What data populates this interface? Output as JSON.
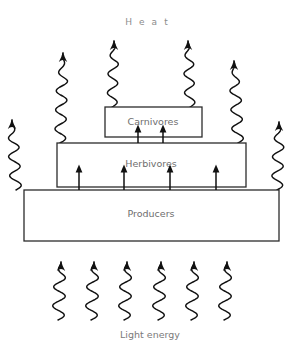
{
  "diagram": {
    "title_label": "Heat",
    "caption_label": "Light energy",
    "background_color": "#ffffff",
    "line_color": "#2b2b2b",
    "text_color": "#6e6e6e",
    "tiers": [
      {
        "id": "carnivores",
        "label": "Carnivores",
        "level": 3,
        "x": 105,
        "y": 107,
        "width": 97,
        "height": 30,
        "label_x": 153,
        "label_y": 122
      },
      {
        "id": "herbivores",
        "label": "Herbivores",
        "level": 2,
        "x": 57,
        "y": 143,
        "width": 189,
        "height": 44,
        "label_x": 151,
        "label_y": 164
      },
      {
        "id": "producers",
        "label": "Producers",
        "level": 1,
        "x": 24,
        "y": 190,
        "width": 255,
        "height": 51,
        "label_x": 151,
        "label_y": 214
      }
    ],
    "energy_flow_arrows": [
      {
        "id": "producers-to-herbivores-1",
        "x": 79,
        "y_start": 190,
        "y_end": 166
      },
      {
        "id": "producers-to-herbivores-2",
        "x": 124,
        "y_start": 190,
        "y_end": 166
      },
      {
        "id": "producers-to-herbivores-3",
        "x": 170,
        "y_start": 190,
        "y_end": 166
      },
      {
        "id": "producers-to-herbivores-4",
        "x": 216,
        "y_start": 190,
        "y_end": 166
      },
      {
        "id": "herbivores-to-carnivores-1",
        "x": 138,
        "y_start": 143,
        "y_end": 126
      },
      {
        "id": "herbivores-to-carnivores-2",
        "x": 163,
        "y_start": 143,
        "y_end": 126
      }
    ],
    "heat_waves": [
      {
        "id": "heat-wave-1",
        "x": 16,
        "y_base": 190,
        "height": 70,
        "amp": 5.5,
        "tilt": -4
      },
      {
        "id": "heat-wave-2",
        "x": 60,
        "y_base": 143,
        "height": 90,
        "amp": 5.5,
        "tilt": 3
      },
      {
        "id": "heat-wave-3",
        "x": 112,
        "y_base": 107,
        "height": 66,
        "amp": 5,
        "tilt": 2
      },
      {
        "id": "heat-wave-4",
        "x": 190,
        "y_base": 107,
        "height": 66,
        "amp": 5,
        "tilt": -2
      },
      {
        "id": "heat-wave-5",
        "x": 238,
        "y_base": 143,
        "height": 82,
        "amp": 5.5,
        "tilt": -4
      },
      {
        "id": "heat-wave-6",
        "x": 277,
        "y_base": 190,
        "height": 68,
        "amp": 5.5,
        "tilt": 2
      }
    ],
    "light_waves": [
      {
        "id": "light-wave-1",
        "x": 58,
        "y_base": 320,
        "height": 58,
        "amp": 6,
        "tilt": 3
      },
      {
        "id": "light-wave-2",
        "x": 91,
        "y_base": 320,
        "height": 58,
        "amp": 6,
        "tilt": 3
      },
      {
        "id": "light-wave-3",
        "x": 124,
        "y_base": 320,
        "height": 58,
        "amp": 6,
        "tilt": 3
      },
      {
        "id": "light-wave-4",
        "x": 158,
        "y_base": 320,
        "height": 58,
        "amp": 6,
        "tilt": 3
      },
      {
        "id": "light-wave-5",
        "x": 191,
        "y_base": 320,
        "height": 58,
        "amp": 6,
        "tilt": 3
      },
      {
        "id": "light-wave-6",
        "x": 224,
        "y_base": 320,
        "height": 58,
        "amp": 6,
        "tilt": 3
      }
    ],
    "title_position": {
      "x": 150,
      "y": 25
    },
    "caption_position": {
      "x": 150,
      "y": 338
    }
  }
}
